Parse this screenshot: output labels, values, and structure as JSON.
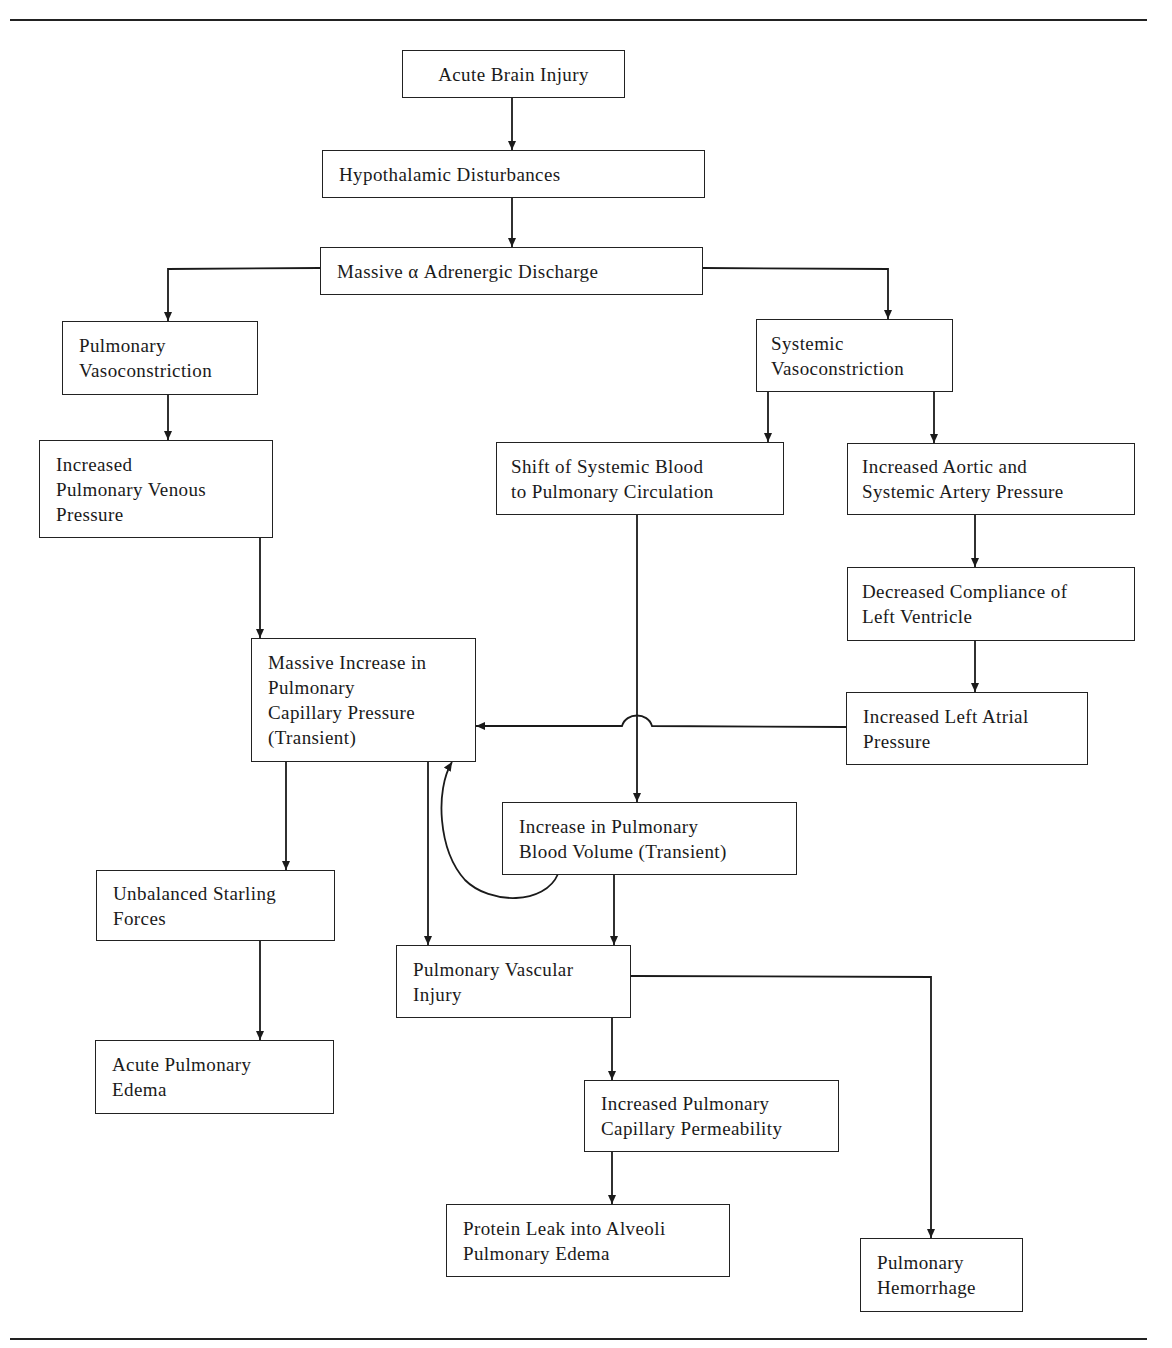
{
  "diagram": {
    "nodes": {
      "acute_brain_injury": {
        "lines": [
          "Acute Brain Injury"
        ]
      },
      "hypothalamic": {
        "lines": [
          "Hypothalamic Disturbances"
        ]
      },
      "adrenergic": {
        "lines": [
          "Massive α Adrenergic Discharge"
        ]
      },
      "pulm_vasoconstriction": {
        "lines": [
          "Pulmonary",
          "Vasoconstriction"
        ]
      },
      "sys_vasoconstriction": {
        "lines": [
          "Systemic",
          "Vasoconstriction"
        ]
      },
      "pulm_venous": {
        "lines": [
          "Increased",
          "Pulmonary Venous",
          "Pressure"
        ]
      },
      "shift_blood": {
        "lines": [
          "Shift of Systemic Blood",
          "to Pulmonary Circulation"
        ]
      },
      "aortic_pressure": {
        "lines": [
          "Increased Aortic and",
          "Systemic Artery Pressure"
        ]
      },
      "lv_compliance": {
        "lines": [
          "Decreased Compliance of",
          "Left Ventricle"
        ]
      },
      "capillary_pressure": {
        "lines": [
          "Massive Increase in",
          "Pulmonary",
          "Capillary Pressure",
          "(Transient)"
        ]
      },
      "left_atrial": {
        "lines": [
          "Increased Left Atrial",
          "Pressure"
        ]
      },
      "blood_volume": {
        "lines": [
          "Increase in Pulmonary",
          "Blood Volume (Transient)"
        ]
      },
      "starling": {
        "lines": [
          "Unbalanced Starling",
          "Forces"
        ]
      },
      "vascular_injury": {
        "lines": [
          "Pulmonary Vascular",
          "Injury"
        ]
      },
      "acute_edema": {
        "lines": [
          "Acute Pulmonary",
          "Edema"
        ]
      },
      "permeability": {
        "lines": [
          "Increased Pulmonary",
          "Capillary Permeability"
        ]
      },
      "protein_leak": {
        "lines": [
          "Protein Leak into Alveoli",
          "Pulmonary Edema"
        ]
      },
      "hemorrhage": {
        "lines": [
          "Pulmonary",
          "Hemorrhage"
        ]
      }
    },
    "edges": [
      [
        "acute_brain_injury",
        "hypothalamic"
      ],
      [
        "hypothalamic",
        "adrenergic"
      ],
      [
        "adrenergic",
        "pulm_vasoconstriction"
      ],
      [
        "adrenergic",
        "sys_vasoconstriction"
      ],
      [
        "pulm_vasoconstriction",
        "pulm_venous"
      ],
      [
        "sys_vasoconstriction",
        "shift_blood"
      ],
      [
        "sys_vasoconstriction",
        "aortic_pressure"
      ],
      [
        "aortic_pressure",
        "lv_compliance"
      ],
      [
        "lv_compliance",
        "left_atrial"
      ],
      [
        "pulm_venous",
        "capillary_pressure"
      ],
      [
        "left_atrial",
        "capillary_pressure"
      ],
      [
        "shift_blood",
        "blood_volume"
      ],
      [
        "blood_volume",
        "capillary_pressure"
      ],
      [
        "capillary_pressure",
        "starling"
      ],
      [
        "capillary_pressure",
        "vascular_injury"
      ],
      [
        "blood_volume",
        "vascular_injury"
      ],
      [
        "starling",
        "acute_edema"
      ],
      [
        "vascular_injury",
        "permeability"
      ],
      [
        "vascular_injury",
        "hemorrhage"
      ],
      [
        "permeability",
        "protein_leak"
      ]
    ]
  }
}
